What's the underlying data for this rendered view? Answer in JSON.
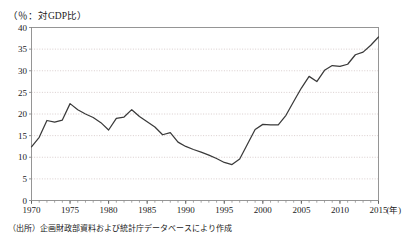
{
  "figure": {
    "y_axis_caption": "（％：対GDP比）",
    "source_note": "（出所）企画財政部資料および統計庁データベースにより作成",
    "x_unit_label": "(年)"
  },
  "chart_data": {
    "type": "line",
    "title": "",
    "subtitle": "",
    "xlabel": "(年)",
    "ylabel": "（％：対GDP比）",
    "xlim": [
      1970,
      2015
    ],
    "ylim": [
      0,
      40
    ],
    "yticks": [
      0,
      5,
      10,
      15,
      20,
      25,
      30,
      35,
      40
    ],
    "ytick_labels": [
      "0",
      "5",
      "10",
      "15",
      "20",
      "25",
      "30",
      "35",
      "40"
    ],
    "xticks": [
      1970,
      1975,
      1980,
      1985,
      1990,
      1995,
      2000,
      2005,
      2010,
      2015
    ],
    "xtick_labels": [
      "1970",
      "1975",
      "1980",
      "1985",
      "1990",
      "1995",
      "2000",
      "2005",
      "2010",
      "2015"
    ],
    "x_minor_tick_interval": 1,
    "grid": "horizontal-dotted",
    "legend": "none",
    "line_color": "#3a3a3a",
    "grid_color": "#c8b8b8",
    "frame_color": "#8a8a8a",
    "series": [
      {
        "name": "対GDP比",
        "x": [
          1970,
          1971,
          1972,
          1973,
          1974,
          1975,
          1976,
          1977,
          1978,
          1979,
          1980,
          1981,
          1982,
          1983,
          1984,
          1985,
          1986,
          1987,
          1988,
          1989,
          1990,
          1991,
          1992,
          1993,
          1994,
          1995,
          1996,
          1997,
          1998,
          1999,
          2000,
          2001,
          2002,
          2003,
          2004,
          2005,
          2006,
          2007,
          2008,
          2009,
          2010,
          2011,
          2012,
          2013,
          2014,
          2015
        ],
        "values": [
          12.4,
          14.6,
          18.5,
          18.1,
          18.6,
          22.4,
          21.0,
          20.0,
          19.2,
          18.0,
          16.3,
          19.0,
          19.3,
          21.0,
          19.4,
          18.2,
          17.0,
          15.2,
          15.7,
          13.5,
          12.5,
          11.8,
          11.2,
          10.5,
          9.7,
          8.8,
          8.3,
          9.6,
          13.0,
          16.4,
          17.6,
          17.5,
          17.5,
          19.7,
          22.9,
          26.0,
          28.7,
          27.5,
          30.1,
          31.2,
          31.0,
          31.5,
          33.7,
          34.3,
          35.9,
          37.8
        ]
      }
    ]
  }
}
